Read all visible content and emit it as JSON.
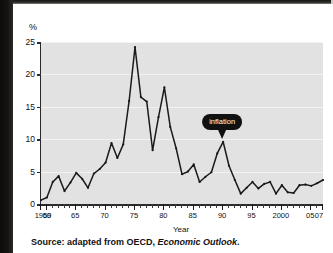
{
  "figure": {
    "source_prefix": "Source: adapted from OECD,",
    "source_title": "Economic Outlook",
    "source_suffix": "."
  },
  "callout": {
    "label": "inflation",
    "points_to_year": 1990,
    "points_to_value": 9.6,
    "bg_color": "#111111",
    "text_color": "#ffffff"
  },
  "colors": {
    "plot_background": "#e2e2e2",
    "gridline": "#f2f2f2",
    "axis": "#2a2a2a",
    "line": "#1a1a1a",
    "page_background": "#ffffff",
    "scan_edge": "#131211"
  },
  "chart_data": {
    "type": "line",
    "title": "",
    "xlabel": "Year",
    "ylabel": "%",
    "ylim": [
      0,
      25
    ],
    "xlim": [
      1959,
      2007
    ],
    "yticks": [
      0,
      5,
      10,
      15,
      20,
      25
    ],
    "ytick_labels": [
      "0",
      "5",
      "10",
      "15",
      "20",
      "25"
    ],
    "xtick_major_years": [
      1959,
      1960,
      1965,
      1970,
      1975,
      1980,
      1985,
      1990,
      1995,
      2000,
      2005,
      2007
    ],
    "xtick_labels": [
      "1959",
      "60",
      "65",
      "70",
      "75",
      "80",
      "85",
      "90",
      "95",
      "2000",
      "05",
      "07"
    ],
    "xtick_interval": 1,
    "grid": true,
    "grid_axis": "y",
    "legend": null,
    "markers": true,
    "series": [
      {
        "name": "inflation",
        "x": [
          1959,
          1960,
          1961,
          1962,
          1963,
          1964,
          1965,
          1966,
          1967,
          1968,
          1969,
          1970,
          1971,
          1972,
          1973,
          1974,
          1975,
          1976,
          1977,
          1978,
          1979,
          1980,
          1981,
          1982,
          1983,
          1984,
          1985,
          1986,
          1987,
          1988,
          1989,
          1990,
          1991,
          1992,
          1993,
          1994,
          1995,
          1996,
          1997,
          1998,
          1999,
          2000,
          2001,
          2002,
          2003,
          2004,
          2005,
          2006,
          2007
        ],
        "values": [
          0.6,
          1.0,
          3.4,
          4.3,
          2.0,
          3.3,
          4.8,
          3.9,
          2.5,
          4.7,
          5.4,
          6.4,
          9.4,
          7.1,
          9.2,
          15.9,
          24.2,
          16.5,
          15.8,
          8.3,
          13.4,
          18.0,
          11.9,
          8.6,
          4.6,
          5.0,
          6.1,
          3.4,
          4.2,
          4.9,
          7.8,
          9.6,
          5.9,
          3.7,
          1.6,
          2.5,
          3.4,
          2.4,
          3.1,
          3.4,
          1.6,
          2.9,
          1.8,
          1.7,
          2.9,
          3.0,
          2.8,
          3.2,
          3.7
        ]
      }
    ]
  }
}
